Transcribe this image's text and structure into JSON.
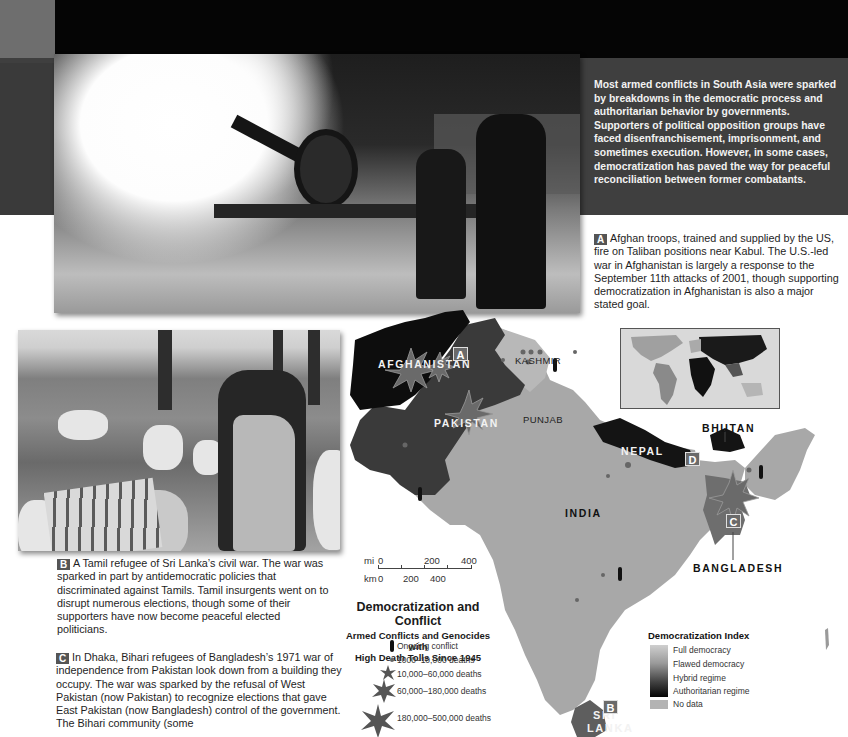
{
  "page": {
    "intro_text": "Most armed conflicts in South Asia were sparked by breakdowns in the democratic process and authoritarian behavior by governments. Supporters of political opposition groups have faced disenfranchisement, imprisonment, and sometimes execution. However, in some cases, democratization has paved the way for peaceful reconciliation between former combatants."
  },
  "captions": {
    "a": {
      "badge": "A",
      "text": "Afghan troops, trained and supplied by the US, fire on Taliban positions near Kabul. The U.S.-led war in Afghanistan is largely a response to the September 11th attacks of 2001, though supporting democratization in Afghanistan is also a major stated goal."
    },
    "b": {
      "badge": "B",
      "text": "A Tamil refugee of Sri Lanka’s civil war. The war was sparked in part by antidemocratic policies that discriminated against Tamils. Tamil insurgents went on to disrupt numerous elections, though some of their supporters have now become peaceful elected politicians."
    },
    "c": {
      "badge": "C",
      "text": "In Dhaka, Bihari refugees of Bangladesh’s 1971 war of independence from Pakistan look down from a building they occupy. The war was sparked by the refusal of West Pakistan (now Pakistan) to recognize elections that gave East Pakistan (now Bangladesh) control of the government. The Bihari community (some"
    }
  },
  "map": {
    "labels": {
      "afghanistan": "AFGHANISTAN",
      "pakistan": "PAKISTAN",
      "kashmir": "KASHMIR",
      "punjab": "PUNJAB",
      "india": "INDIA",
      "nepal": "NEPAL",
      "bhutan": "BHUTAN",
      "bangladesh": "BANGLADESH",
      "sri_lanka_1": "SRI",
      "sri_lanka_2": "LANKA"
    },
    "badges": {
      "a": "A",
      "b": "B",
      "c": "C",
      "d": "D"
    },
    "colors": {
      "authoritarian": "#0d0d0d",
      "hybrid": "#3a3a3a",
      "flawed": "#9a9a9a",
      "india_fill": "#a6a6a6",
      "bangladesh": "#6e6e6e",
      "sri_lanka": "#5e5e5e"
    }
  },
  "scale_bar": {
    "mi_label": "mi",
    "km_label": "km",
    "mi_ticks": [
      "0",
      "200",
      "400"
    ],
    "km_ticks": [
      "0",
      "200",
      "400"
    ]
  },
  "legend_conflict": {
    "title": "Democratization and Conflict",
    "subtitle_1": "Armed Conflicts and Genocides with",
    "subtitle_2": "High Death Tolls Since 1945",
    "items": [
      {
        "icon": "ongoing-conflict-icon",
        "label": "Ongoing conflict"
      },
      {
        "icon": "burst-tiny-icon",
        "label": "1000–10,000 deaths"
      },
      {
        "icon": "burst-small-icon",
        "label": "10,000–60,000 deaths"
      },
      {
        "icon": "burst-medium-icon",
        "label": "60,000–180,000 deaths"
      },
      {
        "icon": "burst-large-icon",
        "label": "180,000–500,000 deaths"
      }
    ]
  },
  "legend_index": {
    "title": "Democratization Index",
    "items": [
      "Full democracy",
      "Flawed democracy",
      "Hybrid regime",
      "Authoritarian regime"
    ],
    "no_data": "No data"
  }
}
